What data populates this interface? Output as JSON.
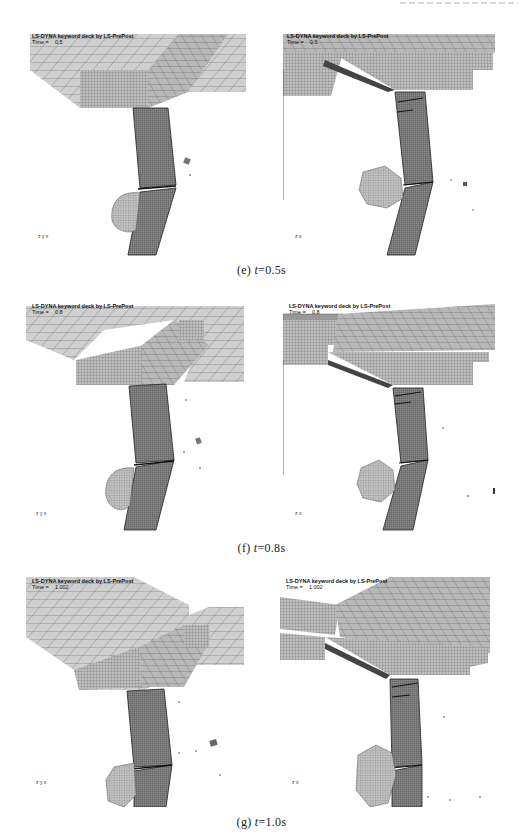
{
  "figure": {
    "header_fragment": "",
    "rows": [
      {
        "id": "e",
        "caption_prefix": "(e)",
        "caption_var": "t",
        "caption_value": "=0.5s",
        "panels": [
          {
            "title": "LS-DYNA keyword deck by LS-PrePost",
            "time_label": "Time =",
            "time_value": "0.5",
            "triad": "z y x"
          },
          {
            "title": "LS-DYNA keyword deck by LS-PrePost",
            "time_label": "Time =",
            "time_value": "0.5",
            "triad": "z x"
          }
        ]
      },
      {
        "id": "f",
        "caption_prefix": "(f)",
        "caption_var": "t",
        "caption_value": "=0.8s",
        "panels": [
          {
            "title": "LS-DYNA keyword deck by LS-PrePost",
            "time_label": "Time =",
            "time_value": "0.8",
            "triad": "z y x"
          },
          {
            "title": "LS-DYNA keyword deck by LS-PrePost",
            "time_label": "Time =",
            "time_value": "0.8",
            "triad": "z x"
          }
        ]
      },
      {
        "id": "g",
        "caption_prefix": "(g)",
        "caption_var": "t",
        "caption_value": "=1.0s",
        "panels": [
          {
            "title": "LS-DYNA keyword deck by LS-PrePost",
            "time_label": "Time =",
            "time_value": "1.002",
            "triad": "z y x"
          },
          {
            "title": "LS-DYNA keyword deck by LS-PrePost",
            "time_label": "Time =",
            "time_value": "1.002",
            "triad": "z x"
          }
        ]
      }
    ]
  },
  "colors": {
    "mesh_fill": "#c8c8c8",
    "mesh_line": "#555555",
    "column_fill": "#7a7a7a",
    "caption_text": "#222222"
  }
}
